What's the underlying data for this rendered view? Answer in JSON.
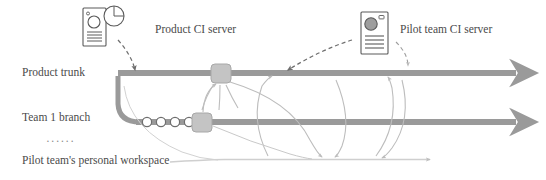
{
  "diagram": {
    "colors": {
      "trunk_line": "#9a9a9a",
      "branch_line": "#9a9a9a",
      "workspace_line": "#c9c9c9",
      "node_fill": "#c4c4c4",
      "node_stroke": "#9a9a9a",
      "commit_fill": "#ffffff",
      "commit_stroke": "#6e6e6e",
      "dashed_arrow": "#6e6e6e",
      "thin_arrow": "#bdbdbd",
      "icon_stroke": "#5a5a5a",
      "text": "#4a4a4a"
    },
    "labels": {
      "product_ci_server": "Product CI server",
      "pilot_ci_server": "Pilot team CI server",
      "product_trunk": "Product trunk",
      "team1_branch": "Team 1 branch",
      "ellipsis": "······",
      "workspace": "Pilot team's personal workspace"
    },
    "icons": {
      "product_ci_server": "server-with-pie-chart-icon",
      "pilot_ci_server": "server-icon",
      "trunk_merge_node": "merge-node-icon",
      "branch_merge_node": "merge-node-icon",
      "commit_node": "commit-node-icon"
    },
    "lanes": [
      {
        "name": "product-trunk",
        "y": 73,
        "label": "Product trunk"
      },
      {
        "name": "team1-branch",
        "y": 122,
        "label": "Team 1 branch"
      },
      {
        "name": "pilot-workspace",
        "y": 160,
        "label": "Pilot team's personal workspace"
      }
    ],
    "commits": [
      {
        "cx": 147,
        "cy": 122
      },
      {
        "cx": 161,
        "cy": 122
      },
      {
        "cx": 175,
        "cy": 122
      },
      {
        "cx": 189,
        "cy": 122
      }
    ],
    "merge_nodes": [
      {
        "name": "trunk-merge-node",
        "x": 211,
        "y": 64,
        "w": 20,
        "h": 19
      },
      {
        "name": "branch-merge-node",
        "x": 192,
        "y": 113,
        "w": 20,
        "h": 19
      }
    ]
  }
}
